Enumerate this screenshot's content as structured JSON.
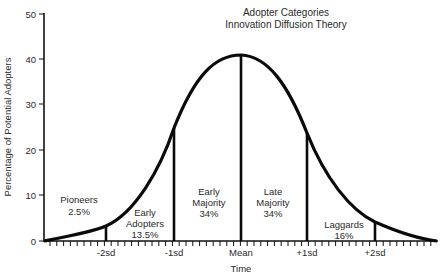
{
  "chart_data": {
    "type": "area",
    "title": "Adopter Categories",
    "subtitle": "Innovation Diffusion Theory",
    "xlabel": "Time",
    "ylabel": "Percentage of Potential Adopters",
    "ylim": [
      0,
      50
    ],
    "yticks": [
      "0",
      "10",
      "20",
      "30",
      "40",
      "50"
    ],
    "xticks": [
      "-2sd",
      "-1sd",
      "Mean",
      "+1sd",
      "+2sd"
    ],
    "grid": false,
    "legend": null,
    "curve": {
      "x": [
        "-3sd",
        "-2sd",
        "-1sd",
        "Mean",
        "+1sd",
        "+2sd",
        "+3sd"
      ],
      "y": [
        0,
        3.5,
        25,
        41,
        24,
        4,
        0
      ]
    },
    "categories": [
      "Pioneers",
      "Early Adopters",
      "Early Majority",
      "Late Majority",
      "Laggards"
    ],
    "values": [
      2.5,
      13.5,
      34,
      34,
      16
    ],
    "segments": [
      {
        "name": "Pioneers",
        "line1": "Pioneers",
        "line2": "",
        "pct": "2.5%",
        "range": [
          "start",
          "-2sd"
        ]
      },
      {
        "name": "Early Adopters",
        "line1": "Early",
        "line2": "Adopters",
        "pct": "13.5%",
        "range": [
          "-2sd",
          "-1sd"
        ]
      },
      {
        "name": "Early Majority",
        "line1": "Early",
        "line2": "Majority",
        "pct": "34%",
        "range": [
          "-1sd",
          "Mean"
        ]
      },
      {
        "name": "Late Majority",
        "line1": "Late",
        "line2": "Majority",
        "pct": "34%",
        "range": [
          "Mean",
          "+1sd"
        ]
      },
      {
        "name": "Laggards",
        "line1": "Laggards",
        "line2": "",
        "pct": "16%",
        "range": [
          "+1sd",
          "end"
        ]
      }
    ]
  }
}
